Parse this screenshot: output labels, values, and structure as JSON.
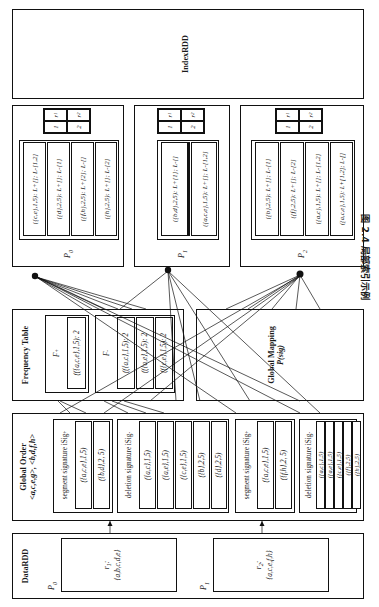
{
  "figure": {
    "caption": "图 2.4  局部索引示例",
    "caption_number": "图 2.4",
    "caption_text": "局部索引示例"
  },
  "panels": {
    "datardd": {
      "title": "DataRDD",
      "partitions": [
        {
          "label": "P",
          "sub": "0",
          "record_id": "r",
          "record_sub": "1",
          "record_value": "{a,b,c,d,e}"
        },
        {
          "label": "P",
          "sub": "1",
          "record_id": "r",
          "record_sub": "2",
          "record_value": "{a,c,e,f,h}"
        }
      ]
    },
    "global_order": {
      "title_line1": "Global Order",
      "title_line2": "<a,c,e,g>, <b,d,f,h>",
      "blocks": [
        {
          "name": "segment signature iSig+",
          "name_base": "segment signature iSig",
          "name_sup": "+",
          "rows": [
            "({a,c,e},1,5)",
            "({b,d},2, 5)"
          ]
        },
        {
          "name": "deletion signature iSig-",
          "name_base": "deletion signature iSig",
          "name_sup": "-",
          "rows": [
            "({a,c},1,5)",
            "({a,e},1,5)",
            "({c,e},1,5)",
            "({b},2,5)",
            "({d},2,5)"
          ]
        },
        {
          "name": "segment signature iSig+",
          "name_base": "segment signature iSig",
          "name_sup": "+",
          "rows": [
            "({a,c,e},1,5)",
            "({f,h},2, 5)"
          ]
        },
        {
          "name": "deletion signature iSig-",
          "name_base": "deletion signature iSig",
          "name_sup": "-",
          "rows": [
            "({a,c},1,5)",
            "({a,e},1,5)",
            "({c,e},1,5)",
            "({f},2,5)",
            "({h},2,5)"
          ]
        }
      ]
    },
    "frequency_table": {
      "title": "Frequency Table",
      "groups": [
        {
          "header": "F+",
          "header_base": "F",
          "header_sup": "+",
          "rows": [
            "(({a,c,e},1,5): 2"
          ]
        },
        {
          "header": "F-",
          "header_base": "F",
          "header_sup": "-",
          "rows": [
            "(({a,c},1,5): 2",
            "(({a,e},1,5): 2",
            "(({c,e},1,5): 2"
          ]
        }
      ]
    },
    "global_mapping": {
      "title_line1": "Global Mapping",
      "title_line2": "P(sig)"
    },
    "indexrdd": {
      "title": "IndexRDD",
      "partitions": [
        {
          "label": "P",
          "sub": "0",
          "rows": [
            "({c,e},1,5): L+[]; L-[1,2]",
            "({d},2,5): L+[]; L-[1]",
            "({f,h},2,5): L+[2]; L-[]",
            "({h},2,5): L+[]; L-[2]"
          ],
          "mini_table": [
            [
              "1",
              "r1"
            ],
            [
              "2",
              "r2"
            ]
          ]
        },
        {
          "label": "P",
          "sub": "1",
          "rows": [
            "({b,d},2,5): L+[1]; L-[]",
            "({a,c,e},1,5): L+[]; L-[1,2]"
          ],
          "mini_table": [
            [
              "1",
              "r1"
            ],
            [
              "2",
              "r2"
            ]
          ]
        },
        {
          "label": "P",
          "sub": "2",
          "rows": [
            "({b},2,5): L+[]; L-[1]",
            "({f},2,5): L+[]; L-[2]",
            "({a,c},1,5): L+[]; L-[1,2]",
            "({a,c,e},1,5): L+[1,2]; L-[]"
          ],
          "mini_table": [
            [
              "1",
              "r1"
            ],
            [
              "2",
              "r2"
            ]
          ]
        }
      ]
    }
  }
}
